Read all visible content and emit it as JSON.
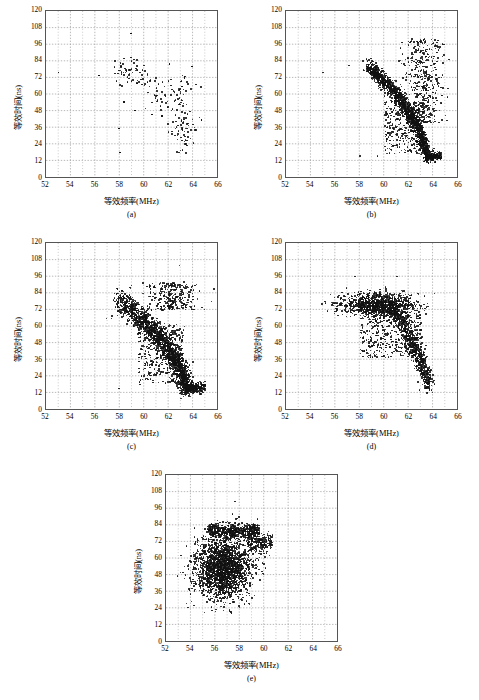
{
  "figure": {
    "bottom_caption": "",
    "panel_count": 5
  },
  "axes": {
    "xlabel": "等效频率(MHz)",
    "ylabel": "等效时间(ns)",
    "xticks": [
      "52",
      "54",
      "56",
      "58",
      "60",
      "62",
      "64",
      "66"
    ],
    "yticks": [
      "0",
      "12",
      "24",
      "36",
      "48",
      "60",
      "72",
      "84",
      "96",
      "108",
      "120"
    ],
    "xlim": [
      52,
      66
    ],
    "ylim": [
      0,
      120
    ],
    "x_major_step": 2,
    "x_minor_step": 1,
    "y_major_step": 12,
    "grid": "dotted-both",
    "grid_color": "#9a9a9a",
    "frame_color": "#555555",
    "marker_color": "#111111"
  },
  "panels": [
    {
      "id": "a",
      "label": "(a)"
    },
    {
      "id": "b",
      "label": "(b)"
    },
    {
      "id": "c",
      "label": "(c)"
    },
    {
      "id": "d",
      "label": "(d)"
    },
    {
      "id": "e",
      "label": "(e)"
    }
  ],
  "chart_data": [
    {
      "type": "scatter",
      "panel": "(a)",
      "title": "",
      "xlabel": "等效频率(MHz)",
      "ylabel": "等效时间(ns)",
      "xlim": [
        52,
        66
      ],
      "ylim": [
        0,
        120
      ],
      "xticks": [
        52,
        54,
        56,
        58,
        60,
        62,
        64,
        66
      ],
      "yticks": [
        0,
        12,
        24,
        36,
        48,
        60,
        72,
        84,
        96,
        108,
        120
      ],
      "grid": true,
      "legend": null,
      "n_points": 190,
      "description": "Sparse scatter; loose arc of points from (58,75) trending right and downward, with a dense vertical cluster near x=63 spanning y=20 to y=72; isolated outliers at (53,76), (56.3,74), (59,104), (64.6,42).",
      "cluster_model": {
        "mode": "sparse-arc",
        "arc": {
          "x_start": 57.6,
          "x_end": 63.4,
          "y_start": 78,
          "y_end": 30,
          "thickness": 7,
          "n": 95
        },
        "column": {
          "x_center": 63.1,
          "x_spread": 0.55,
          "y_min": 18,
          "y_max": 74,
          "n": 80
        },
        "outliers": [
          [
            53.0,
            76.0
          ],
          [
            56.3,
            74.0
          ],
          [
            58.9,
            104.0
          ],
          [
            57.9,
            36.0
          ],
          [
            58.0,
            19.0
          ],
          [
            64.6,
            42.0
          ],
          [
            63.8,
            80.5
          ],
          [
            62.0,
            82.0
          ],
          [
            60.6,
            46.0
          ],
          [
            61.4,
            45.0
          ],
          [
            59.2,
            49.0
          ],
          [
            58.3,
            55.0
          ]
        ]
      },
      "points_x": [
        53.0,
        56.3,
        57.6,
        57.7,
        57.9,
        58.0,
        58.1,
        58.3,
        58.5,
        58.6,
        58.8,
        58.9,
        59.0,
        59.2,
        59.4,
        59.6,
        59.8,
        60.0,
        60.2,
        60.4,
        60.6,
        60.9,
        61.1,
        61.4,
        61.6,
        61.9,
        62.0,
        62.2,
        62.4,
        62.6,
        62.8,
        63.0,
        63.1,
        63.2,
        63.3,
        63.4,
        63.5,
        63.8,
        64.6
      ],
      "points_y": [
        76.0,
        74.0,
        75.5,
        70.0,
        36.0,
        19.0,
        76.5,
        55.0,
        77.0,
        73.0,
        78.0,
        104.0,
        76.0,
        49.0,
        77.5,
        76.0,
        78.0,
        77.0,
        75.0,
        70.0,
        46.0,
        72.0,
        68.0,
        45.0,
        66.0,
        70.0,
        82.0,
        64.0,
        62.0,
        60.0,
        58.0,
        56.0,
        40.0,
        34.0,
        28.0,
        24.0,
        30.0,
        80.5,
        42.0
      ]
    },
    {
      "type": "scatter",
      "panel": "(b)",
      "title": "",
      "xlabel": "等效频率(MHz)",
      "ylabel": "等效时间(ns)",
      "xlim": [
        52,
        66
      ],
      "ylim": [
        0,
        120
      ],
      "xticks": [
        52,
        54,
        56,
        58,
        60,
        62,
        64,
        66
      ],
      "yticks": [
        0,
        12,
        24,
        36,
        48,
        60,
        72,
        84,
        96,
        108,
        120
      ],
      "grid": true,
      "legend": null,
      "n_points": 2600,
      "description": "Very dense comma-shaped arc starting at (58.6,81) running right then bending sharply down near x=63.3 to a horizontal tail at y=16; broad spray of points above the bend reaching y=100 near x=63; scattered low-density points between x=60 and x=63 below the arc.",
      "cluster_model": {
        "mode": "dense-arc",
        "arc": {
          "x_start": 58.6,
          "x_knee": 62.3,
          "x_end": 63.5,
          "y_start": 80,
          "y_knee": 55,
          "y_end": 16,
          "thickness": 3.5,
          "n": 1500
        },
        "tail": {
          "x_start": 63.3,
          "x_end": 64.6,
          "y": 16,
          "spread": 1.6,
          "n": 330
        },
        "spray": {
          "x_center": 63.1,
          "x_spread": 0.85,
          "y_min": 40,
          "y_max": 100,
          "n": 450
        },
        "halo": {
          "x_min": 60.0,
          "x_max": 63.2,
          "y_min": 18,
          "y_max": 55,
          "n": 320
        },
        "outliers": [
          [
            55.0,
            76.0
          ],
          [
            57.1,
            81.0
          ],
          [
            58.0,
            16.5
          ],
          [
            59.4,
            16.5
          ],
          [
            60.9,
            24.0
          ],
          [
            64.6,
            16.0
          ]
        ]
      }
    },
    {
      "type": "scatter",
      "panel": "(c)",
      "title": "",
      "xlabel": "等效频率(MHz)",
      "ylabel": "等效时间(ns)",
      "xlim": [
        52,
        66
      ],
      "ylim": [
        0,
        120
      ],
      "xticks": [
        52,
        54,
        56,
        58,
        60,
        62,
        64,
        66
      ],
      "yticks": [
        0,
        12,
        24,
        36,
        48,
        60,
        72,
        84,
        96,
        108,
        120
      ],
      "grid": true,
      "legend": null,
      "n_points": 3000,
      "description": "Dense comma/hook shape: thick horizontal band from (57.9,79) to (61,74) descending through (62.5,50) and bending down to a bright vertical tail at x=63.4 reaching y=16, then a short horizontal tail extending right to x=64.8 at y=16.",
      "cluster_model": {
        "mode": "dense-hook",
        "arc": {
          "x_start": 57.9,
          "x_knee": 62.2,
          "x_end": 63.4,
          "y_start": 79,
          "y_knee": 52,
          "y_end": 17,
          "thickness": 5.0,
          "n": 1800
        },
        "tail": {
          "x_start": 63.3,
          "x_end": 64.9,
          "y": 16.5,
          "spread": 1.8,
          "n": 350
        },
        "spray": {
          "x_center": 62.2,
          "x_spread": 1.0,
          "y_min": 72,
          "y_max": 92,
          "n": 300
        },
        "halo": {
          "x_min": 59.5,
          "x_max": 63.2,
          "y_min": 20,
          "y_max": 62,
          "n": 380
        },
        "outliers": [
          [
            56.9,
            66.0
          ],
          [
            57.3,
            66.0
          ],
          [
            58.6,
            65.0
          ],
          [
            57.9,
            16.0
          ],
          [
            59.6,
            19.0
          ],
          [
            62.8,
            104.0
          ],
          [
            63.9,
            35.0
          ],
          [
            60.6,
            36.0
          ]
        ]
      }
    },
    {
      "type": "scatter",
      "panel": "(d)",
      "title": "",
      "xlabel": "等效频率(MHz)",
      "ylabel": "等效时间(ns)",
      "xlim": [
        52,
        66
      ],
      "ylim": [
        0,
        120
      ],
      "xticks": [
        52,
        54,
        56,
        58,
        60,
        62,
        64,
        66
      ],
      "yticks": [
        0,
        12,
        24,
        36,
        48,
        60,
        72,
        84,
        96,
        108,
        120
      ],
      "grid": true,
      "legend": null,
      "n_points": 2400,
      "description": "Thick elongated lens-shaped cloud centred near (59.5,76) spanning x=57.5 to x=61.5, tapering rightward and downward through (62.5,50) to a narrow tail at (63.6,17); moderate scatter above the lens reaching y=96 near x=61.",
      "cluster_model": {
        "mode": "lens-taper",
        "lens": {
          "x_center": 59.4,
          "y_center": 76,
          "x_spread": 1.5,
          "y_spread": 4.0,
          "n": 1100
        },
        "arc": {
          "x_start": 60.5,
          "x_knee": 62.5,
          "x_end": 63.6,
          "y_start": 74,
          "y_knee": 50,
          "y_end": 18,
          "thickness": 4.5,
          "n": 800
        },
        "halo": {
          "x_min": 58.0,
          "x_max": 63.0,
          "y_min": 38,
          "y_max": 70,
          "n": 380
        },
        "outliers": [
          [
            56.9,
            88.0
          ],
          [
            57.6,
            96.0
          ],
          [
            61.0,
            96.0
          ],
          [
            60.1,
            87.0
          ],
          [
            62.7,
            84.0
          ],
          [
            63.2,
            82.0
          ],
          [
            58.2,
            60.0
          ],
          [
            62.3,
            40.0
          ],
          [
            59.3,
            54.0
          ],
          [
            61.7,
            43.0
          ]
        ]
      }
    },
    {
      "type": "scatter",
      "panel": "(e)",
      "title": "",
      "xlabel": "等效频率(MHz)",
      "ylabel": "等效时间(ns)",
      "xlim": [
        52,
        66
      ],
      "ylim": [
        0,
        120
      ],
      "xticks": [
        52,
        54,
        56,
        58,
        60,
        62,
        64,
        66
      ],
      "yticks": [
        0,
        12,
        24,
        36,
        48,
        60,
        72,
        84,
        96,
        108,
        120
      ],
      "grid": true,
      "legend": null,
      "n_points": 3200,
      "description": "Large dense roughly circular blob spanning x=54 to x=59.5 and y=28 to y=86, densest near (56.6,54); a flattened dense cap along y=80 extending to x=59.8, and a thin rightward extension near y=70 reaching x=60.5.",
      "cluster_model": {
        "mode": "blob",
        "blob": {
          "x_center": 56.6,
          "y_center": 54,
          "x_spread": 1.15,
          "y_spread": 11.0,
          "n": 2200
        },
        "cap": {
          "x_min": 55.4,
          "x_max": 59.6,
          "y_center": 80,
          "y_spread": 2.6,
          "n": 600
        },
        "spur": {
          "x_min": 58.6,
          "x_max": 60.6,
          "y_center": 71,
          "y_spread": 3.5,
          "n": 220
        },
        "outliers": [
          [
            57.6,
            101.0
          ],
          [
            57.4,
            92.0
          ],
          [
            57.9,
            90.0
          ],
          [
            60.2,
            77.0
          ],
          [
            60.5,
            70.0
          ],
          [
            59.8,
            57.0
          ],
          [
            59.6,
            45.0
          ],
          [
            54.1,
            44.0
          ],
          [
            53.9,
            38.0
          ],
          [
            58.5,
            30.0
          ]
        ]
      }
    }
  ]
}
